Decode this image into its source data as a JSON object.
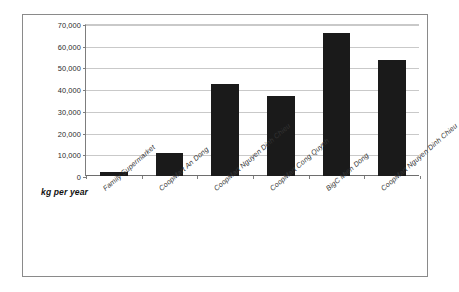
{
  "chart_data": {
    "type": "bar",
    "title": "",
    "xlabel": "kg per year",
    "ylabel": "",
    "categories": [
      "Family Supermarket",
      "CoopMart An Dong",
      "CoopMart Nguyen Dinh Chieu",
      "CoopMart Cong Quynh",
      "BigC Mien Dong",
      "CoopMart Nguyen Dinh Chieu"
    ],
    "values": [
      1700,
      10700,
      42300,
      37000,
      66000,
      53500
    ],
    "ylim": [
      0,
      70000
    ],
    "ytick_values": [
      0,
      10000,
      20000,
      30000,
      40000,
      50000,
      60000,
      70000
    ],
    "ytick_labels": [
      "0",
      "10,000",
      "20,000",
      "30,000",
      "40,000",
      "50,000",
      "60,000",
      "70,000"
    ],
    "grid": true,
    "legend": false,
    "bar_color": "#1a1a1a",
    "gridline_color": "#c9c9c9",
    "axis_color": "#7d7d7d",
    "frame_color": "#8a8a8a",
    "background": "#ffffff"
  }
}
